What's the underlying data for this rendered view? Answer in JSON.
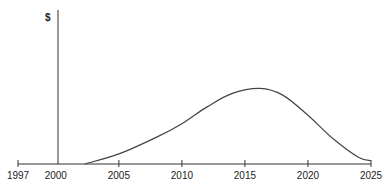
{
  "chart_data": {
    "type": "line",
    "title": "",
    "xlabel": "",
    "ylabel": "$",
    "x_ticks": [
      1997,
      2000,
      2005,
      2010,
      2015,
      2020,
      2025
    ],
    "xlim": [
      1997,
      2025
    ],
    "y_axis_at_x": 2000,
    "grid": false,
    "legend": null,
    "series": [
      {
        "name": "curve",
        "x": [
          2002.3,
          2005,
          2008,
          2010,
          2012,
          2014,
          2016.2,
          2018,
          2020,
          2022,
          2024,
          2025
        ],
        "y": [
          0,
          0.12,
          0.32,
          0.48,
          0.68,
          0.84,
          0.9,
          0.82,
          0.58,
          0.3,
          0.08,
          0.04
        ]
      }
    ]
  },
  "labels": {
    "y_axis": "$",
    "ticks": [
      "1997",
      "2000",
      "2005",
      "2010",
      "2015",
      "2020",
      "2025"
    ]
  }
}
